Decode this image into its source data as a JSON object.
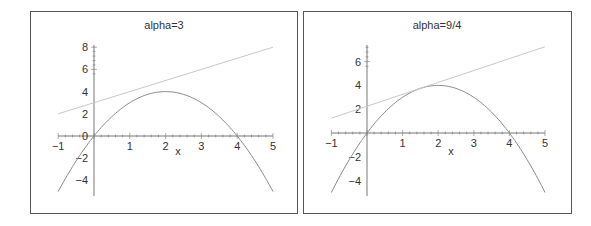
{
  "chart_data": [
    {
      "type": "line",
      "title": "alpha=3",
      "xlabel": "x",
      "ylabel": "",
      "xlim": [
        -1,
        5
      ],
      "ylim": [
        -5,
        8
      ],
      "x_ticks": [
        -1,
        1,
        2,
        3,
        4,
        5
      ],
      "y_ticks": [
        -4,
        -2,
        0,
        2,
        4,
        6,
        8
      ],
      "grid": false,
      "legend": null,
      "series": [
        {
          "name": "f(x) = 4x - x^2",
          "color": "#8a8a8a",
          "x": [
            -1,
            0,
            1,
            2,
            3,
            4,
            5
          ],
          "values": [
            -5,
            0,
            3,
            4,
            3,
            0,
            -5
          ]
        },
        {
          "name": "y = x + 3",
          "color": "#c8c8c8",
          "x": [
            -1,
            5
          ],
          "values": [
            2,
            8
          ]
        }
      ]
    },
    {
      "type": "line",
      "title": "alpha=9/4",
      "xlabel": "x",
      "ylabel": "",
      "xlim": [
        -1,
        5
      ],
      "ylim": [
        -5,
        7.4
      ],
      "x_ticks": [
        -1,
        1,
        2,
        3,
        4,
        5
      ],
      "y_ticks": [
        -4,
        -2,
        2,
        4,
        6
      ],
      "grid": false,
      "legend": null,
      "series": [
        {
          "name": "f(x) = 4x - x^2",
          "color": "#8a8a8a",
          "x": [
            -1,
            0,
            1,
            2,
            3,
            4,
            5
          ],
          "values": [
            -5,
            0,
            3,
            4,
            3,
            0,
            -5
          ]
        },
        {
          "name": "y = x + 9/4",
          "color": "#c8c8c8",
          "x": [
            -1,
            5
          ],
          "values": [
            1.25,
            7.25
          ]
        }
      ]
    }
  ],
  "panels": {
    "left": {
      "title": "alpha=3",
      "xlabel": "x"
    },
    "right": {
      "title": "alpha=9/4",
      "xlabel": "x"
    }
  }
}
